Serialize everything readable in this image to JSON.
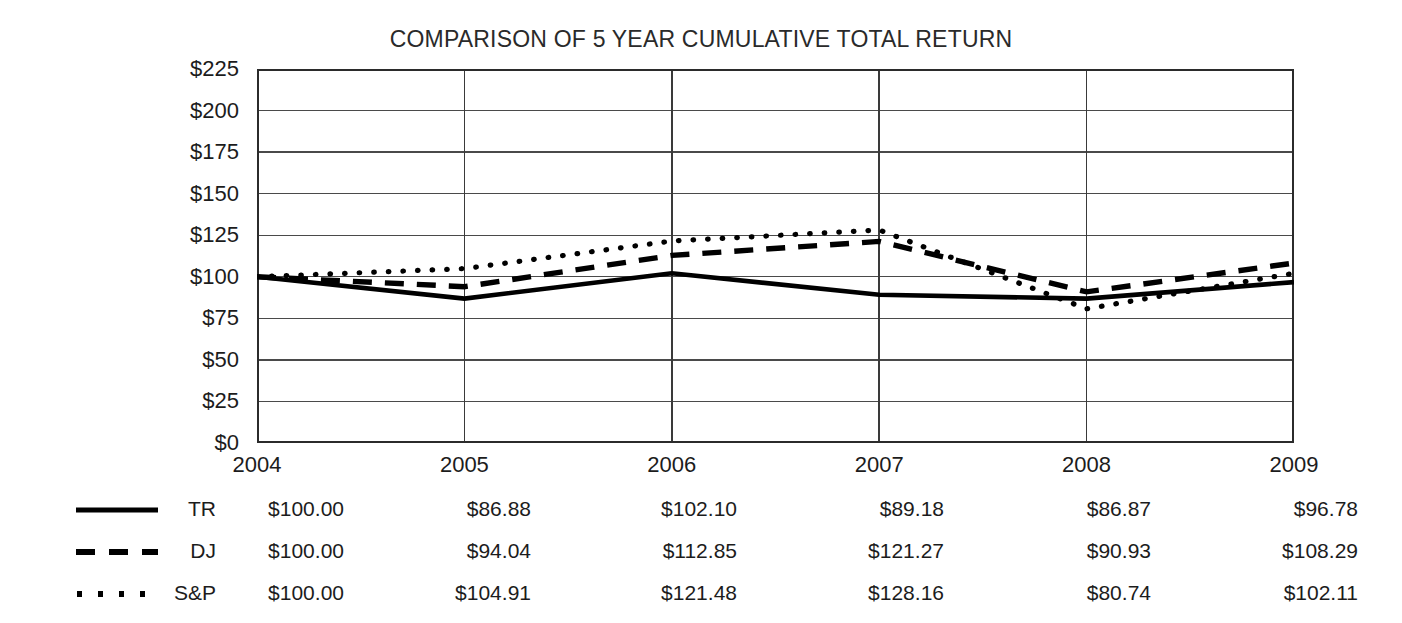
{
  "chart_data": {
    "type": "line",
    "title": "COMPARISON OF 5 YEAR CUMULATIVE TOTAL RETURN",
    "xlabel": "",
    "ylabel": "",
    "categories": [
      "2004",
      "2005",
      "2006",
      "2007",
      "2008",
      "2009"
    ],
    "ylim": [
      0,
      225
    ],
    "ytick_values": [
      0,
      25,
      50,
      75,
      100,
      125,
      150,
      175,
      200,
      225
    ],
    "ytick_labels": [
      "$0",
      "$25",
      "$50",
      "$75",
      "$100",
      "$125",
      "$150",
      "$175",
      "$200",
      "$225"
    ],
    "grid": "horizontal-and-vertical",
    "legend_position": "below-plot-as-table",
    "series": [
      {
        "name": "TR",
        "style": "solid",
        "color": "#000000",
        "values": [
          100.0,
          86.88,
          102.1,
          89.18,
          86.87,
          96.78
        ],
        "labels": [
          "$100.00",
          "$86.88",
          "$102.10",
          "$89.18",
          "$86.87",
          "$96.78"
        ]
      },
      {
        "name": "DJ",
        "style": "dashed",
        "color": "#000000",
        "values": [
          100.0,
          94.04,
          112.85,
          121.27,
          90.93,
          108.29
        ],
        "labels": [
          "$100.00",
          "$94.04",
          "$112.85",
          "$121.27",
          "$90.93",
          "$108.29"
        ]
      },
      {
        "name": "S&P",
        "style": "dotted",
        "color": "#000000",
        "values": [
          100.0,
          104.91,
          121.48,
          128.16,
          80.74,
          102.11
        ],
        "labels": [
          "$100.00",
          "$104.91",
          "$121.48",
          "$128.16",
          "$80.74",
          "$102.11"
        ]
      }
    ]
  },
  "yticks": {
    "t225": "$225",
    "t200": "$200",
    "t175": "$175",
    "t150": "$150",
    "t125": "$125",
    "t100": "$100",
    "t75": "$75",
    "t50": "$50",
    "t25": "$25",
    "t0": "$0"
  },
  "xticks": {
    "x2004": "2004",
    "x2005": "2005",
    "x2006": "2006",
    "x2007": "2007",
    "x2008": "2008",
    "x2009": "2009"
  },
  "legend": {
    "rows": [
      {
        "name": "TR",
        "v2004": "$100.00",
        "v2005": "$86.88",
        "v2006": "$102.10",
        "v2007": "$89.18",
        "v2008": "$86.87",
        "v2009": "$96.78"
      },
      {
        "name": "DJ",
        "v2004": "$100.00",
        "v2005": "$94.04",
        "v2006": "$112.85",
        "v2007": "$121.27",
        "v2008": "$90.93",
        "v2009": "$108.29"
      },
      {
        "name": "S&P",
        "v2004": "$100.00",
        "v2005": "$104.91",
        "v2006": "$121.48",
        "v2007": "$128.16",
        "v2008": "$80.74",
        "v2009": "$102.11"
      }
    ]
  },
  "colors": {
    "background": "#ffffff",
    "ink": "#1a1a1a",
    "axis": "#2b2b2b",
    "grid": "#4a4a4a",
    "series": "#000000"
  }
}
